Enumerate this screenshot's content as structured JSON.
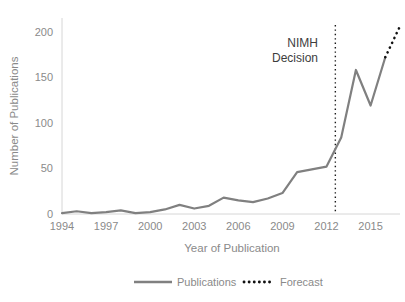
{
  "chart_data": {
    "type": "line",
    "title": "",
    "xlabel": "Year of Publication",
    "ylabel": "Number of Publications",
    "xlim": [
      1994,
      2017
    ],
    "ylim": [
      0,
      215
    ],
    "yticks": [
      0,
      50,
      100,
      150,
      200
    ],
    "ytick_labels": [
      "0",
      "50",
      "100",
      "150",
      "200"
    ],
    "xticks": [
      1994,
      1997,
      2000,
      2003,
      2006,
      2009,
      2012,
      2015
    ],
    "xtick_labels": [
      "1994",
      "1997",
      "2000",
      "2003",
      "2006",
      "2009",
      "2012",
      "2015"
    ],
    "grid": false,
    "legend_position": "bottom",
    "x": [
      1994,
      1995,
      1996,
      1997,
      1998,
      1999,
      2000,
      2001,
      2002,
      2003,
      2004,
      2005,
      2006,
      2007,
      2008,
      2009,
      2010,
      2011,
      2012,
      2013,
      2014,
      2015,
      2016
    ],
    "series": [
      {
        "name": "Publications",
        "style": "solid",
        "color": "#808080",
        "x": [
          1994,
          1995,
          1996,
          1997,
          1998,
          1999,
          2000,
          2001,
          2002,
          2003,
          2004,
          2005,
          2006,
          2007,
          2008,
          2009,
          2010,
          2011,
          2012,
          2013,
          2014,
          2015,
          2016
        ],
        "values": [
          1,
          3,
          1,
          2,
          4,
          1,
          2,
          5,
          10,
          6,
          9,
          18,
          15,
          13,
          17,
          23,
          46,
          49,
          52,
          84,
          158,
          119,
          172
        ]
      },
      {
        "name": "Forecast",
        "style": "dotted",
        "color": "#111111",
        "x": [
          2016,
          2017
        ],
        "values": [
          172,
          206
        ]
      }
    ],
    "annotations": [
      {
        "name": "nimh-decision",
        "label_line1": "NIMH",
        "label_line2": "Decision",
        "x": 2012.6,
        "style": "vertical-dotted-line",
        "color": "#1a1a1a"
      }
    ]
  },
  "legend": {
    "items": [
      {
        "label": "Publications",
        "style": "solid",
        "color": "#808080"
      },
      {
        "label": "Forecast",
        "style": "dotted",
        "color": "#111111"
      }
    ]
  },
  "axes": {
    "y_title": "Number of Publications",
    "x_title": "Year of Publication"
  },
  "colors": {
    "line": "#808080",
    "forecast": "#111111",
    "axis": "#d6d6d6",
    "tick_text": "#8a8a8a",
    "annotation_text": "#3d3d3d",
    "background": "#ffffff"
  }
}
